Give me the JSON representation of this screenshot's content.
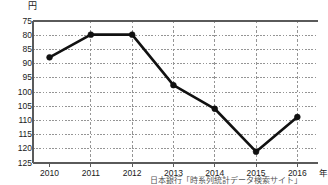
{
  "chart_data": {
    "type": "line",
    "title": "",
    "subtitle": "",
    "xlabel": "年",
    "ylabel": "円",
    "categories": [
      "2010",
      "2011",
      "2012",
      "2013",
      "2014",
      "2015",
      "2016"
    ],
    "x": [
      2010,
      2011,
      2012,
      2013,
      2014,
      2015,
      2016
    ],
    "values": [
      87.8,
      79.8,
      79.8,
      97.6,
      105.9,
      121.0,
      108.8
    ],
    "series": [
      {
        "name": "円相場（ドル円）",
        "values": [
          87.8,
          79.8,
          79.8,
          97.6,
          105.9,
          121.0,
          108.8
        ]
      }
    ],
    "ylim": [
      75,
      125
    ],
    "y_inverted": true,
    "yticks": [
      75,
      80,
      85,
      90,
      95,
      100,
      105,
      110,
      115,
      120,
      125
    ],
    "ytick_labels": [
      "75",
      "80",
      "85",
      "90",
      "95",
      "100",
      "105",
      "110",
      "115",
      "120",
      "125"
    ],
    "xlim": [
      2009.6,
      2016.5
    ],
    "grid": true,
    "grid_style": "dotted",
    "legend": false,
    "legend_position": "none",
    "marker": "circle",
    "line_color": "#111111",
    "grid_color": "#8a8a8a",
    "axis_color": "#6b6b6b",
    "annotations": []
  },
  "axes": {
    "unit_top_label": "円",
    "unit_right_label": "年"
  },
  "footer": {
    "source_note": "日本銀行「時系列統計データ検索サイト」"
  }
}
